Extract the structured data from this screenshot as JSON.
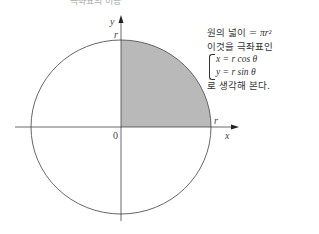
{
  "header": {
    "clipped_text": "극좌표의 이용"
  },
  "diagram": {
    "axis_labels": {
      "x": "x",
      "y": "y",
      "origin": "0"
    },
    "radius_labels": {
      "top": "r",
      "right": "r"
    },
    "shaded_region": "first-quadrant quarter circle",
    "colors": {
      "shade": "#b9b9b9",
      "stroke": "#555555"
    }
  },
  "note": {
    "line1_prefix": "원의 넓이 = ",
    "line1_math": "πr²",
    "line2": "이것을 극좌표인",
    "eq1": "x = r cos θ",
    "eq2": "y = r sin θ",
    "line5": "로 생각해 본다."
  }
}
